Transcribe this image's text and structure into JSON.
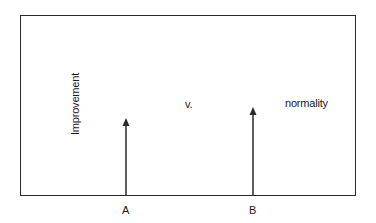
{
  "diagram": {
    "left_label": "Improvement",
    "middle_label": "v.",
    "right_label": "normality",
    "arrows": [
      {
        "label": "A",
        "x": 126,
        "top": 120
      },
      {
        "label": "B",
        "x": 253,
        "top": 109
      }
    ],
    "colors": {
      "line": "#2a2a2a",
      "background": "#ffffff"
    }
  }
}
